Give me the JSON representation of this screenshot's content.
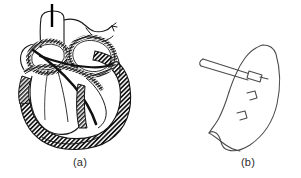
{
  "figure": {
    "type": "anatomical-line-drawing",
    "background_color": "#ffffff",
    "line_color": "#1a1a1a",
    "caption_color": "#2b2b2b",
    "panels": [
      {
        "id": "a",
        "label": "(a)",
        "title": "Heart cross-section with needle entering aorta",
        "elements": [
          "aorta-trunk",
          "pulmonary-artery",
          "needle-shaft",
          "left-atrium-chamber",
          "right-atrium-chamber",
          "left-ventricle-chamber",
          "right-ventricle-chamber",
          "hatched-myocardium-wall",
          "interventricular-septum",
          "valve-leaflets"
        ]
      },
      {
        "id": "b",
        "label": "(b)",
        "title": "Detail of tissue flap with needle and staples",
        "elements": [
          "tissue-flap-outline",
          "needle-shaft",
          "needle-hub",
          "staple-upper",
          "staple-lower",
          "flap-fold-corner"
        ]
      }
    ]
  },
  "captions": {
    "panel_a": "(a)",
    "panel_b": "(b)"
  }
}
